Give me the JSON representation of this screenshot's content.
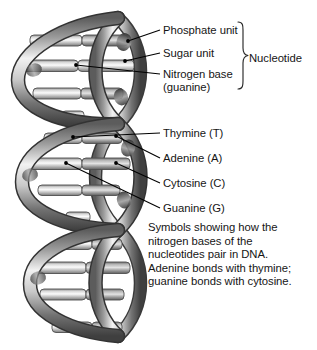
{
  "diagram": {
    "title_alt": "DNA double helix structure with labeled nucleotide components",
    "colors": {
      "background": "#ffffff",
      "text": "#161616",
      "leader_line": "#000000",
      "backbone_dark": "#4a4a4a",
      "backbone_mid": "#8f8f8f",
      "backbone_light": "#e8e8e8",
      "rung_light": "#f0f0f0",
      "rung_mid": "#b4b4b4",
      "rung_dark": "#6e6e6e"
    }
  },
  "callouts": {
    "phosphate": "Phosphate unit",
    "sugar": "Sugar unit",
    "nitrogen_base_line1": "Nitrogen base",
    "nitrogen_base_line2": "(guanine)",
    "nucleotide": "Nucleotide",
    "thymine": "Thymine (T)",
    "adenine": "Adenine (A)",
    "cytosine": "Cytosine (C)",
    "guanine": "Guanine (G)"
  },
  "caption": {
    "text": "Symbols showing how the\nnitrogen bases of the\nnucleotides pair in DNA.\nAdenine bonds with thymine;\nguanine bonds with cytosine."
  }
}
